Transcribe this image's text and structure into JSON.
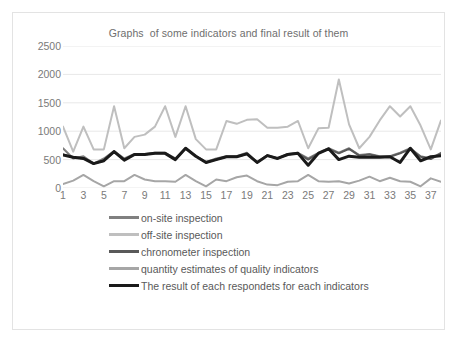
{
  "chart_data": {
    "type": "line",
    "title": "Graphs  of some indicators and final result of them",
    "xlabel": "",
    "ylabel": "",
    "ylim": [
      0,
      2500
    ],
    "yticks": [
      0,
      500,
      1000,
      1500,
      2000,
      2500
    ],
    "xticks": [
      1,
      3,
      5,
      7,
      9,
      11,
      13,
      15,
      17,
      19,
      21,
      23,
      25,
      27,
      29,
      31,
      33,
      35,
      37
    ],
    "grid": true,
    "legend_position": "bottom",
    "x": [
      1,
      2,
      3,
      4,
      5,
      6,
      7,
      8,
      9,
      10,
      11,
      12,
      13,
      14,
      15,
      16,
      17,
      18,
      19,
      20,
      21,
      22,
      23,
      24,
      25,
      26,
      27,
      28,
      29,
      30,
      31,
      32,
      33,
      34,
      35,
      36,
      37,
      38
    ],
    "series": [
      {
        "name": "on-site inspection",
        "color": "#808080",
        "width": 2,
        "values": [
          700,
          520,
          560,
          430,
          520,
          650,
          520,
          600,
          600,
          620,
          620,
          520,
          700,
          560,
          460,
          520,
          560,
          560,
          620,
          450,
          580,
          520,
          600,
          620,
          520,
          620,
          700,
          620,
          700,
          580,
          600,
          560,
          560,
          620,
          700,
          560,
          520,
          620
        ]
      },
      {
        "name": "off-site inspection",
        "color": "#bfbfbf",
        "width": 2,
        "values": [
          1080,
          640,
          1080,
          680,
          680,
          1440,
          700,
          900,
          940,
          1080,
          1440,
          900,
          1440,
          860,
          680,
          680,
          1180,
          1130,
          1200,
          1210,
          1060,
          1060,
          1080,
          1180,
          700,
          1050,
          1060,
          1910,
          1120,
          700,
          900,
          1190,
          1440,
          1260,
          1440,
          1100,
          680,
          1190
        ]
      },
      {
        "name": "chronometer inspection",
        "color": "#595959",
        "width": 2,
        "values": [
          590,
          540,
          520,
          430,
          480,
          640,
          490,
          590,
          590,
          610,
          610,
          500,
          700,
          560,
          450,
          500,
          550,
          550,
          600,
          450,
          570,
          520,
          590,
          610,
          500,
          610,
          690,
          610,
          690,
          570,
          590,
          550,
          550,
          610,
          690,
          550,
          510,
          610
        ]
      },
      {
        "name": "quantity estimates of quality indicators",
        "color": "#a6a6a6",
        "width": 2,
        "values": [
          70,
          130,
          230,
          120,
          30,
          120,
          120,
          230,
          150,
          120,
          120,
          110,
          230,
          120,
          30,
          150,
          120,
          190,
          220,
          120,
          60,
          50,
          110,
          120,
          230,
          120,
          110,
          120,
          80,
          130,
          200,
          120,
          180,
          120,
          110,
          30,
          170,
          110
        ]
      },
      {
        "name": "The result of each respondets for each indicators",
        "color": "#1a1a1a",
        "width": 3,
        "values": [
          580,
          540,
          520,
          430,
          480,
          640,
          490,
          590,
          590,
          610,
          610,
          500,
          700,
          560,
          450,
          500,
          550,
          550,
          600,
          450,
          570,
          520,
          590,
          610,
          400,
          610,
          690,
          500,
          560,
          540,
          540,
          540,
          550,
          450,
          700,
          480,
          550,
          570
        ]
      }
    ]
  },
  "legend": {
    "items": [
      {
        "label": "on-site inspection"
      },
      {
        "label": "off-site inspection"
      },
      {
        "label": "chronometer inspection"
      },
      {
        "label": "quantity estimates of quality indicators"
      },
      {
        "label": "The result of each respondets for each indicators"
      }
    ]
  }
}
